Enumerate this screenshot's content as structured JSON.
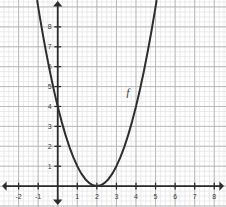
{
  "figure": {
    "width": 226,
    "height": 207,
    "background": "#ffffff"
  },
  "chart_data": {
    "type": "line",
    "title": "",
    "subtitle": "",
    "xlabel": "",
    "ylabel": "",
    "function_label": "f",
    "expression": "f(x) = (x - 2)^2",
    "vertex": [
      2,
      0
    ],
    "y_intercept": [
      0,
      4
    ],
    "xlim": [
      -2.95,
      8.6
    ],
    "ylim": [
      -1.05,
      9.35
    ],
    "grid": {
      "major_on": true,
      "minor_on": true,
      "major_step": 1,
      "minor_step": 0.25,
      "major_color": "#b4b4b4",
      "minor_color": "#e2e2e2"
    },
    "axis_color": "#2b2b2b",
    "curve_color": "#2e2e2e",
    "curve_width": 2,
    "legend_position": "none",
    "xticks": [
      -2,
      -1,
      1,
      2,
      3,
      4,
      5,
      6,
      7,
      8
    ],
    "xtick_labels": [
      "-2",
      "-1",
      "1",
      "2",
      "3",
      "4",
      "5",
      "6",
      "7",
      "8"
    ],
    "yticks": [
      1,
      2,
      3,
      4,
      5,
      6,
      7,
      8
    ],
    "ytick_labels": [
      "1",
      "2",
      "3",
      "4",
      "5",
      "6",
      "7",
      "8"
    ],
    "x": [
      -1.05,
      -0.9,
      -0.75,
      -0.6,
      -0.45,
      -0.3,
      -0.15,
      0,
      0.2,
      0.4,
      0.6,
      0.8,
      1,
      1.2,
      1.4,
      1.6,
      1.8,
      2,
      2.2,
      2.4,
      2.6,
      2.8,
      3,
      3.2,
      3.4,
      3.6,
      3.8,
      4,
      4.2,
      4.4,
      4.6,
      4.8,
      5,
      5.05
    ],
    "y": [
      9.3025,
      8.41,
      7.5625,
      6.76,
      6.0025,
      5.29,
      4.6225,
      4,
      3.24,
      2.56,
      1.96,
      1.44,
      1,
      0.64,
      0.36,
      0.16,
      0.04,
      0,
      0.04,
      0.16,
      0.36,
      0.64,
      1,
      1.44,
      1.96,
      2.56,
      3.24,
      4,
      4.84,
      5.76,
      6.76,
      7.84,
      9,
      9.3025
    ],
    "annotations": [
      {
        "text": "f",
        "x": 3.58,
        "y": 4.55,
        "style": "italic"
      }
    ],
    "axis_arrows": [
      "left",
      "right",
      "up",
      "down"
    ]
  }
}
